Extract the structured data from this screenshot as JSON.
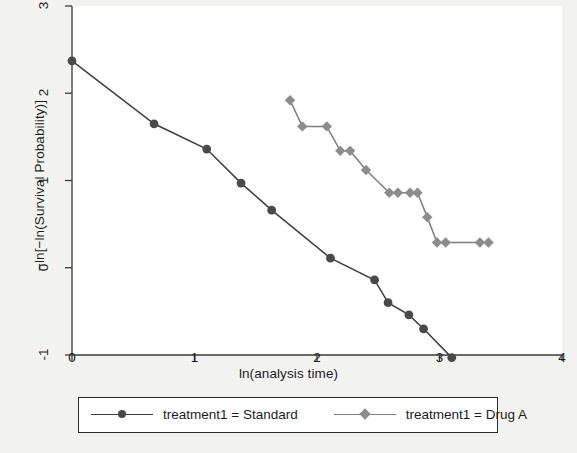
{
  "chart_data": {
    "type": "line",
    "title": "",
    "xlabel": "ln(analysis time)",
    "ylabel": "−ln[−ln(Survival Probability)]",
    "xlim": [
      0,
      4
    ],
    "ylim": [
      -1,
      3
    ],
    "xticks": [
      0,
      1,
      2,
      3,
      4
    ],
    "xtick_labels": [
      "0",
      "1",
      "2",
      "3",
      "4"
    ],
    "yticks": [
      -1,
      0,
      1,
      2,
      3
    ],
    "ytick_labels": [
      "-1",
      "0",
      "1",
      "2",
      "3"
    ],
    "grid": false,
    "legend_position": "bottom",
    "series": [
      {
        "name": "treatment1 = Standard",
        "color": "#4a4a4a",
        "marker": "circle",
        "x": [
          0.0,
          0.67,
          1.1,
          1.38,
          1.63,
          2.11,
          2.47,
          2.58,
          2.75,
          2.87,
          3.1
        ],
        "y": [
          2.37,
          1.65,
          1.36,
          0.97,
          0.66,
          0.11,
          -0.14,
          -0.4,
          -0.54,
          -0.7,
          -1.03
        ]
      },
      {
        "name": "treatment1 = Drug A",
        "color": "#8c8c8c",
        "marker": "diamond",
        "x": [
          1.78,
          1.88,
          2.08,
          2.19,
          2.27,
          2.4,
          2.59,
          2.66,
          2.76,
          2.82,
          2.9,
          2.98,
          3.05,
          3.33,
          3.4
        ],
        "y": [
          1.92,
          1.62,
          1.62,
          1.34,
          1.34,
          1.12,
          0.86,
          0.86,
          0.86,
          0.86,
          0.58,
          0.29,
          0.29,
          0.29,
          0.29
        ]
      }
    ]
  },
  "legend": {
    "entries": [
      {
        "label": "treatment1 = Standard"
      },
      {
        "label": "treatment1 = Drug A"
      }
    ]
  },
  "axes": {
    "x_title": "ln(analysis time)",
    "y_title": "−ln[−ln(Survival Probability)]"
  },
  "colors": {
    "standard": "#4a4a4a",
    "drug_a": "#8c8c8c",
    "axis": "#3a3a3a",
    "background": "#f2f2f0",
    "plot_background": "#ffffff"
  }
}
